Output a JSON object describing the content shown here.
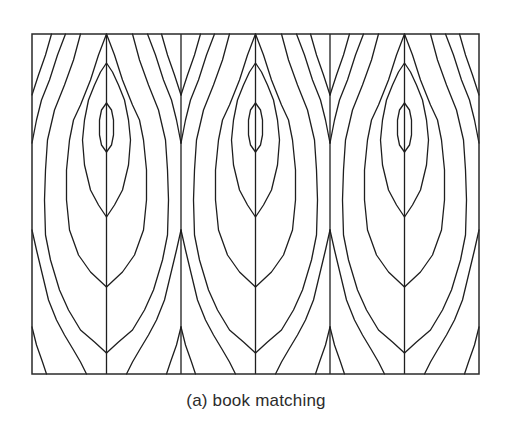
{
  "figure": {
    "caption": "(a) book matching",
    "colors": {
      "line": "#1e1e1e",
      "background": "#ffffff",
      "caption": "#2b2b2b"
    }
  },
  "layout": {
    "frame": {
      "x": 32,
      "y": 34,
      "width": 447,
      "height": 340
    },
    "panel_count": 3,
    "panel_width": 149,
    "half_leaf_width": 74.5,
    "panel_seams_x": [
      106.5,
      255.5,
      404.5
    ],
    "panel_dividers_x": [
      181,
      330
    ]
  },
  "grain_lines": {
    "description": "Half-leaf contours as [distance-from-seam, y] pairs; mirrored on both sides of each seam",
    "lens": [
      [
        0,
        103
      ],
      [
        5,
        110
      ],
      [
        7,
        120
      ],
      [
        7,
        135
      ],
      [
        5,
        145
      ],
      [
        0,
        152
      ]
    ],
    "B": [
      [
        0,
        63
      ],
      [
        6,
        72
      ],
      [
        12,
        85
      ],
      [
        18,
        100
      ],
      [
        22,
        120
      ],
      [
        24,
        140
      ],
      [
        22,
        165
      ],
      [
        16,
        190
      ],
      [
        8,
        205
      ],
      [
        0,
        217
      ]
    ],
    "C": [
      [
        0,
        34
      ],
      [
        8,
        55
      ],
      [
        16,
        80
      ],
      [
        26,
        105
      ],
      [
        33,
        120
      ],
      [
        37,
        140
      ],
      [
        40,
        170
      ],
      [
        40,
        200
      ],
      [
        37,
        230
      ],
      [
        28,
        255
      ],
      [
        16,
        272
      ],
      [
        0,
        287
      ]
    ],
    "D": [
      [
        26,
        34
      ],
      [
        33,
        60
      ],
      [
        42,
        85
      ],
      [
        52,
        110
      ],
      [
        59,
        140
      ],
      [
        61,
        170
      ],
      [
        62,
        200
      ],
      [
        61,
        235
      ],
      [
        56,
        260
      ],
      [
        47,
        290
      ],
      [
        38,
        310
      ],
      [
        26,
        330
      ],
      [
        12,
        342
      ],
      [
        0,
        353
      ]
    ],
    "E": [
      [
        41,
        34
      ],
      [
        49,
        55
      ],
      [
        57,
        80
      ],
      [
        65,
        100
      ],
      [
        70,
        120
      ],
      [
        74.5,
        143
      ]
    ],
    "F": [
      [
        55,
        34
      ],
      [
        61,
        55
      ],
      [
        68,
        75
      ],
      [
        74.5,
        95
      ]
    ],
    "G": [
      [
        74.5,
        230
      ],
      [
        70,
        250
      ],
      [
        64,
        275
      ],
      [
        58,
        300
      ],
      [
        50,
        320
      ],
      [
        42,
        335
      ],
      [
        33,
        350
      ],
      [
        26,
        362
      ],
      [
        20,
        374
      ]
    ],
    "H": [
      [
        74.5,
        327
      ],
      [
        70,
        345
      ],
      [
        64,
        362
      ],
      [
        60,
        374
      ]
    ]
  }
}
